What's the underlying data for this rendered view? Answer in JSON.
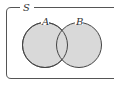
{
  "diagram": {
    "type": "venn",
    "universe_label": "S",
    "sets": [
      {
        "label": "A",
        "shaded": true
      },
      {
        "label": "B",
        "shaded": true
      }
    ],
    "shaded_region": "A ∪ B",
    "colors": {
      "fill": "#d9d9d9",
      "stroke": "#444444",
      "frame": "#555555"
    }
  }
}
